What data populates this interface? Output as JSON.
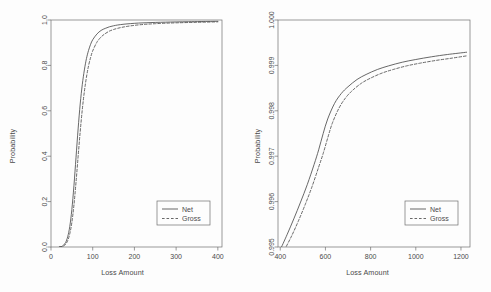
{
  "chart_data": [
    {
      "panel": "left",
      "type": "line",
      "title": "",
      "xlabel": "Loss Amount",
      "ylabel": "Probability",
      "xlim": [
        0,
        410
      ],
      "ylim": [
        0.0,
        1.0
      ],
      "xticks": [
        0,
        100,
        200,
        300,
        400
      ],
      "xtick_labels": [
        "0",
        "100",
        "200",
        "300",
        "400"
      ],
      "yticks": [
        0.0,
        0.2,
        0.4,
        0.6,
        0.8,
        1.0
      ],
      "ytick_labels": [
        "0.0",
        "0.2",
        "0.4",
        "0.6",
        "0.8",
        "1.0"
      ],
      "grid": false,
      "legend_position": "lower right",
      "series": [
        {
          "name": "Net",
          "style": "solid",
          "color": "#4d4d4d",
          "x": [
            20,
            25,
            30,
            35,
            40,
            45,
            50,
            55,
            60,
            65,
            70,
            75,
            80,
            85,
            90,
            95,
            100,
            110,
            120,
            130,
            140,
            150,
            160,
            175,
            190,
            210,
            230,
            250,
            275,
            300,
            330,
            360,
            400
          ],
          "y": [
            0.0,
            0.002,
            0.008,
            0.02,
            0.045,
            0.09,
            0.165,
            0.27,
            0.395,
            0.52,
            0.63,
            0.715,
            0.78,
            0.83,
            0.866,
            0.893,
            0.913,
            0.938,
            0.954,
            0.963,
            0.97,
            0.9745,
            0.978,
            0.9815,
            0.984,
            0.9865,
            0.988,
            0.9893,
            0.9905,
            0.9915,
            0.9925,
            0.9933,
            0.9942
          ]
        },
        {
          "name": "Gross",
          "style": "dashed",
          "color": "#4d4d4d",
          "x": [
            20,
            25,
            30,
            35,
            40,
            45,
            50,
            55,
            60,
            65,
            70,
            75,
            80,
            85,
            90,
            95,
            100,
            110,
            120,
            130,
            140,
            150,
            160,
            175,
            190,
            210,
            230,
            250,
            275,
            300,
            330,
            360,
            400
          ],
          "y": [
            0.0,
            0.001,
            0.004,
            0.012,
            0.028,
            0.058,
            0.108,
            0.185,
            0.285,
            0.398,
            0.508,
            0.605,
            0.685,
            0.748,
            0.798,
            0.835,
            0.864,
            0.902,
            0.925,
            0.94,
            0.951,
            0.958,
            0.9635,
            0.9695,
            0.974,
            0.9785,
            0.9815,
            0.9838,
            0.986,
            0.9875,
            0.989,
            0.9903,
            0.9918
          ]
        }
      ],
      "legend": {
        "entries": [
          {
            "label": "Net",
            "style": "solid"
          },
          {
            "label": "Gross",
            "style": "dashed"
          }
        ]
      }
    },
    {
      "panel": "right",
      "type": "line",
      "title": "",
      "xlabel": "Loss Amount",
      "ylabel": "Probability",
      "xlim": [
        390,
        1240
      ],
      "ylim": [
        0.995,
        1.0
      ],
      "xticks": [
        400,
        600,
        800,
        1000,
        1200
      ],
      "xtick_labels": [
        "400",
        "600",
        "800",
        "1000",
        "1200"
      ],
      "yticks": [
        0.995,
        0.996,
        0.997,
        0.998,
        0.999,
        1.0
      ],
      "ytick_labels": [
        "0.995",
        "0.996",
        "0.997",
        "0.998",
        "0.999",
        "1.000"
      ],
      "grid": false,
      "legend_position": "lower right",
      "series": [
        {
          "name": "Net",
          "style": "solid",
          "color": "#4d4d4d",
          "x": [
            400,
            430,
            460,
            490,
            520,
            550,
            570,
            590,
            610,
            640,
            670,
            700,
            740,
            780,
            830,
            880,
            940,
            1000,
            1070,
            1140,
            1225
          ],
          "y": [
            0.99494,
            0.99527,
            0.99562,
            0.99599,
            0.99638,
            0.99682,
            0.99714,
            0.9975,
            0.99782,
            0.99816,
            0.99838,
            0.99853,
            0.99869,
            0.9988,
            0.99891,
            0.99899,
            0.99907,
            0.99913,
            0.99919,
            0.99924,
            0.99929
          ]
        },
        {
          "name": "Gross",
          "style": "dashed",
          "color": "#4d4d4d",
          "x": [
            418,
            450,
            480,
            510,
            540,
            570,
            590,
            610,
            630,
            660,
            690,
            720,
            760,
            800,
            850,
            900,
            960,
            1020,
            1090,
            1160,
            1225
          ],
          "y": [
            0.99493,
            0.99524,
            0.99557,
            0.99593,
            0.99632,
            0.99676,
            0.99706,
            0.9974,
            0.99772,
            0.99806,
            0.99829,
            0.99845,
            0.99861,
            0.99872,
            0.99883,
            0.99891,
            0.99899,
            0.99905,
            0.99911,
            0.99916,
            0.99921
          ]
        }
      ],
      "legend": {
        "entries": [
          {
            "label": "Net",
            "style": "solid"
          },
          {
            "label": "Gross",
            "style": "dashed"
          }
        ]
      }
    }
  ],
  "style": {
    "line_color": "#4d4d4d",
    "axis_color": "#6e6e6e",
    "text_color": "#4a4a4a",
    "background": "#fdfdfd"
  }
}
